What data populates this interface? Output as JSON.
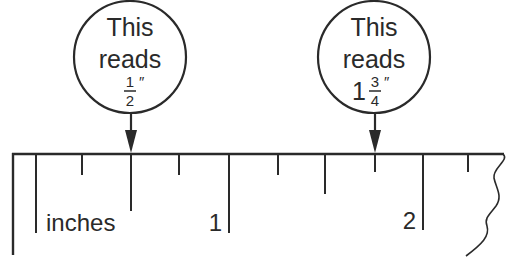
{
  "diagram": {
    "colors": {
      "ink": "#2a2a2a",
      "background": "#ffffff"
    },
    "callouts": [
      {
        "id": "half-inch",
        "line1": "This",
        "line2": "reads",
        "whole": "",
        "numerator": "1",
        "denominator": "2",
        "unit_mark": "″",
        "points_to_inches": 0.5
      },
      {
        "id": "one-three-quarters",
        "line1": "This",
        "line2": "reads",
        "whole": "1",
        "numerator": "3",
        "denominator": "4",
        "unit_mark": "″",
        "points_to_inches": 1.75
      }
    ],
    "ruler": {
      "unit_label": "inches",
      "major_labels": [
        "1",
        "2"
      ],
      "tick_interval": "1/4 inch",
      "right_edge": "torn"
    }
  }
}
